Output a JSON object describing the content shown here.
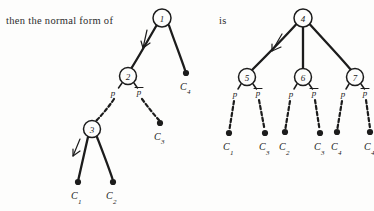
{
  "figure": {
    "kind": "hand-drawn-tableau-trees",
    "text_left": "then the normal form of",
    "text_right": "is"
  },
  "left_tree": {
    "name": "original-tree",
    "nodes": [
      {
        "id": "1",
        "label": "1",
        "cx": 162,
        "cy": 18,
        "r": 9
      },
      {
        "id": "2",
        "label": "2",
        "cx": 128,
        "cy": 76,
        "r": 8.5
      },
      {
        "id": "3",
        "label": "3",
        "cx": 92,
        "cy": 129,
        "r": 8.5
      }
    ],
    "branch_labels": [
      {
        "text": "p",
        "overbar": false,
        "x": 113,
        "y": 96
      },
      {
        "text": "p",
        "overbar": true,
        "x": 139,
        "y": 95
      }
    ],
    "leaves": [
      {
        "letter": "C",
        "sub": "4",
        "dx": 186,
        "dy": 73,
        "lx": 182,
        "ly": 89
      },
      {
        "letter": "C",
        "sub": "3",
        "dx": 160,
        "dy": 123,
        "lx": 156,
        "ly": 140
      },
      {
        "letter": "C",
        "sub": "1",
        "dx": 78,
        "dy": 182,
        "lx": 73,
        "ly": 199
      },
      {
        "letter": "C",
        "sub": "2",
        "dx": 113,
        "dy": 182,
        "lx": 109,
        "ly": 199
      }
    ]
  },
  "right_tree": {
    "name": "normal-form-tree",
    "nodes": [
      {
        "id": "4",
        "label": "4",
        "cx": 303,
        "cy": 18,
        "r": 9
      },
      {
        "id": "5",
        "label": "5",
        "cx": 247,
        "cy": 77,
        "r": 8.5
      },
      {
        "id": "6",
        "label": "6",
        "cx": 303,
        "cy": 77,
        "r": 8.5
      },
      {
        "id": "7",
        "label": "7",
        "cx": 355,
        "cy": 77,
        "r": 8.5
      }
    ],
    "branch_labels": [
      {
        "text": "p",
        "overbar": false,
        "x": 235,
        "y": 97
      },
      {
        "text": "p",
        "overbar": true,
        "x": 258,
        "y": 96
      },
      {
        "text": "p",
        "overbar": false,
        "x": 291,
        "y": 97
      },
      {
        "text": "p",
        "overbar": true,
        "x": 314,
        "y": 96
      },
      {
        "text": "p",
        "overbar": false,
        "x": 343,
        "y": 97
      },
      {
        "text": "p",
        "overbar": true,
        "x": 365,
        "y": 96
      }
    ],
    "leaves": [
      {
        "letter": "C",
        "sub": "1",
        "dx": 229,
        "dy": 133,
        "lx": 224,
        "ly": 150
      },
      {
        "letter": "C",
        "sub": "3",
        "dx": 265,
        "dy": 133,
        "lx": 260,
        "ly": 150
      },
      {
        "letter": "C",
        "sub": "2",
        "dx": 285,
        "dy": 132,
        "lx": 280,
        "ly": 150
      },
      {
        "letter": "C",
        "sub": "3",
        "dx": 320,
        "dy": 133,
        "lx": 315,
        "ly": 150
      },
      {
        "letter": "C",
        "sub": "4",
        "dx": 337,
        "dy": 132,
        "lx": 332,
        "ly": 150
      },
      {
        "letter": "C",
        "sub": "4",
        "dx": 370,
        "dy": 132,
        "lx": 365,
        "ly": 150
      }
    ]
  }
}
